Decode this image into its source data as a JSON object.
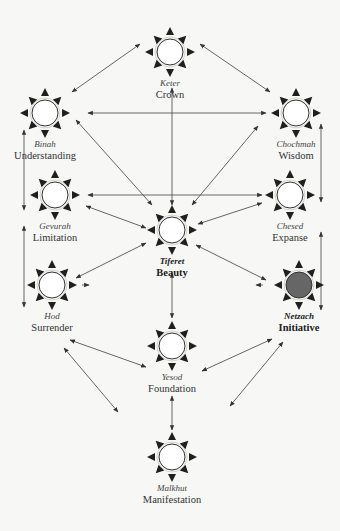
{
  "diagram": {
    "title": "",
    "colors": {
      "background": "#f7f7f6",
      "ink": "#222222",
      "line": "#555555",
      "circle_fill": "#ffffff",
      "highlight_fill": "#666666"
    },
    "nodes": [
      {
        "id": "keter",
        "hebrew": "Keter",
        "english": "Crown",
        "x": 170,
        "y": 52,
        "highlighted": false,
        "bold": false
      },
      {
        "id": "binah",
        "hebrew": "Binah",
        "english": "Understanding",
        "x": 45,
        "y": 113,
        "highlighted": false,
        "bold": false
      },
      {
        "id": "chochmah",
        "hebrew": "Chochmah",
        "english": "Wisdom",
        "x": 296,
        "y": 113,
        "highlighted": false,
        "bold": false
      },
      {
        "id": "gevurah",
        "hebrew": "Gevurah",
        "english": "Limitation",
        "x": 55,
        "y": 195,
        "highlighted": false,
        "bold": false
      },
      {
        "id": "chesed",
        "hebrew": "Chesed",
        "english": "Expanse",
        "x": 290,
        "y": 195,
        "highlighted": false,
        "bold": false
      },
      {
        "id": "tiferet",
        "hebrew": "Tiferet",
        "english": "Beauty",
        "x": 172,
        "y": 230,
        "highlighted": false,
        "bold": true
      },
      {
        "id": "hod",
        "hebrew": "Hod",
        "english": "Surrender",
        "x": 52,
        "y": 285,
        "highlighted": false,
        "bold": false
      },
      {
        "id": "netzach",
        "hebrew": "Netzach",
        "english": "Initiative",
        "x": 299,
        "y": 285,
        "highlighted": true,
        "bold": true
      },
      {
        "id": "yesod",
        "hebrew": "Yesod",
        "english": "Foundation",
        "x": 172,
        "y": 346,
        "highlighted": false,
        "bold": false
      },
      {
        "id": "malkhut",
        "hebrew": "Malkhut",
        "english": "Manifestation",
        "x": 172,
        "y": 457,
        "highlighted": false,
        "bold": false
      }
    ],
    "arrows": [
      {
        "x1": 140,
        "y1": 44,
        "x2": 72,
        "y2": 92,
        "heads": "both"
      },
      {
        "x1": 200,
        "y1": 44,
        "x2": 270,
        "y2": 92,
        "heads": "both"
      },
      {
        "x1": 88,
        "y1": 113,
        "x2": 266,
        "y2": 113,
        "heads": "both"
      },
      {
        "x1": 172,
        "y1": 88,
        "x2": 172,
        "y2": 205,
        "heads": "both"
      },
      {
        "x1": 76,
        "y1": 120,
        "x2": 152,
        "y2": 205,
        "heads": "both"
      },
      {
        "x1": 258,
        "y1": 126,
        "x2": 192,
        "y2": 205,
        "heads": "both"
      },
      {
        "x1": 88,
        "y1": 195,
        "x2": 262,
        "y2": 195,
        "heads": "both"
      },
      {
        "x1": 86,
        "y1": 206,
        "x2": 146,
        "y2": 228,
        "heads": "both"
      },
      {
        "x1": 262,
        "y1": 203,
        "x2": 198,
        "y2": 224,
        "heads": "both"
      },
      {
        "x1": 146,
        "y1": 243,
        "x2": 76,
        "y2": 278,
        "heads": "both"
      },
      {
        "x1": 196,
        "y1": 245,
        "x2": 266,
        "y2": 280,
        "heads": "both"
      },
      {
        "x1": 172,
        "y1": 273,
        "x2": 172,
        "y2": 318,
        "heads": "both"
      },
      {
        "x1": 24,
        "y1": 130,
        "x2": 24,
        "y2": 210,
        "heads": "both"
      },
      {
        "x1": 24,
        "y1": 226,
        "x2": 24,
        "y2": 307,
        "heads": "both"
      },
      {
        "x1": 321,
        "y1": 124,
        "x2": 321,
        "y2": 202,
        "heads": "both"
      },
      {
        "x1": 321,
        "y1": 232,
        "x2": 321,
        "y2": 310,
        "heads": "both"
      },
      {
        "x1": 70,
        "y1": 340,
        "x2": 146,
        "y2": 367,
        "heads": "both"
      },
      {
        "x1": 272,
        "y1": 339,
        "x2": 202,
        "y2": 371,
        "heads": "both"
      },
      {
        "x1": 64,
        "y1": 348,
        "x2": 118,
        "y2": 412,
        "heads": "both"
      },
      {
        "x1": 283,
        "y1": 342,
        "x2": 230,
        "y2": 406,
        "heads": "both"
      },
      {
        "x1": 172,
        "y1": 396,
        "x2": 172,
        "y2": 430,
        "heads": "both"
      },
      {
        "x1": 263,
        "y1": 285,
        "x2": 256,
        "y2": 285,
        "heads": "end"
      },
      {
        "x1": 82,
        "y1": 285,
        "x2": 89,
        "y2": 285,
        "heads": "end"
      }
    ]
  }
}
